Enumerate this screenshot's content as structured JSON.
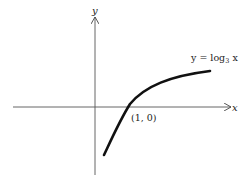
{
  "figure": {
    "axes": {
      "x_label": "x",
      "y_label": "y"
    },
    "curve": {
      "label_prefix": "y = log",
      "label_base": "3",
      "label_suffix": " x",
      "function": "log base 3 of x",
      "color": "#111111"
    },
    "point": {
      "label": "(1, 0)"
    }
  }
}
